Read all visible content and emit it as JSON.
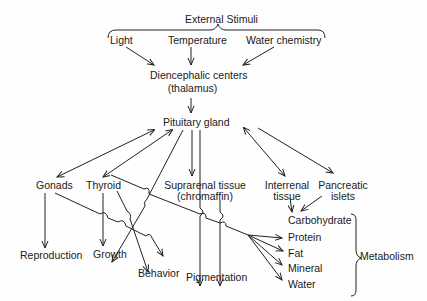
{
  "diagram": {
    "title": "External Stimuli",
    "stimuli": [
      "Light",
      "Temperature",
      "Water chemistry"
    ],
    "diencephalic": {
      "line1": "Diencephalic centers",
      "line2": "(thalamus)"
    },
    "pituitary": "Pituitary gland",
    "glands": {
      "gonads": "Gonads",
      "thyroid": "Thyroid",
      "suprarenal": {
        "line1": "Suprarenal tissue",
        "line2": "(chromaffin)"
      },
      "interrenal": {
        "line1": "Interrenal",
        "line2": "tissue"
      },
      "pancreatic": {
        "line1": "Pancreatic",
        "line2": "islets"
      }
    },
    "effects": {
      "reproduction": "Reproduction",
      "growth": "Growth",
      "behavior": "Behavior",
      "pigmentation": "Pigmentation"
    },
    "metabolism": {
      "label": "Metabolism",
      "items": [
        "Carbohydrate",
        "Protein",
        "Fat",
        "Mineral",
        "Water"
      ]
    }
  }
}
